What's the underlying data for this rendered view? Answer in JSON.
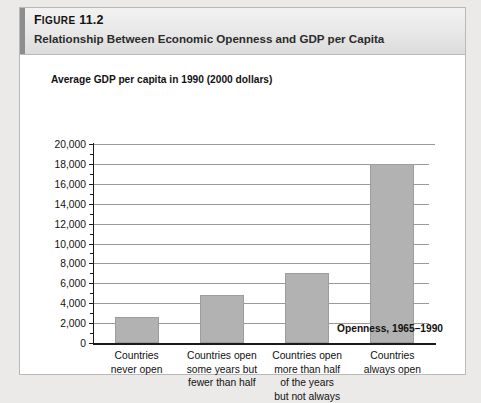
{
  "figure": {
    "label_prefix": "F",
    "label_rest": "IGURE",
    "label_number": "11.2",
    "label_full": "FIGURE 11.2",
    "subtitle": "Relationship Between Economic Openness and GDP per Capita",
    "accent_color": "#8d8d8d",
    "panel_background": "#ffffff",
    "page_background": "#eceae8"
  },
  "chart_data": {
    "type": "bar",
    "title": "Relationship Between Economic Openness and GDP per Capita",
    "ylabel": "Average GDP per capita in 1990 (2000 dollars)",
    "xlabel": "Openness, 1965–1990",
    "categories": [
      "Countries\nnever open",
      "Countries open\nsome years but\nfewer than half",
      "Countries open\nmore than half\nof the years\nbut not always",
      "Countries\nalways open"
    ],
    "category_lines": [
      [
        "Countries",
        "never open"
      ],
      [
        "Countries open",
        "some years but",
        "fewer than half"
      ],
      [
        "Countries open",
        "more than half",
        "of the years",
        "but not always"
      ],
      [
        "Countries",
        "always open"
      ]
    ],
    "values": [
      2600,
      4800,
      7000,
      18000
    ],
    "ylim": [
      0,
      20000
    ],
    "ytick_labels": [
      "20,000",
      "18,000",
      "16,000",
      "14,000",
      "12,000",
      "10,000",
      "8,000",
      "6,000",
      "4,000",
      "2,000",
      "0"
    ],
    "ytick_values": [
      20000,
      18000,
      16000,
      14000,
      12000,
      10000,
      8000,
      6000,
      4000,
      2000,
      0
    ],
    "ytick_minor_values": [
      19000,
      17000,
      15000,
      13000,
      11000,
      9000,
      7000,
      5000,
      3000,
      1000
    ],
    "grid": true,
    "legend": "none",
    "bar_color": "#b2b2b2",
    "gridline_color": "#9a9a9a",
    "axis_color": "#1a1a1a"
  }
}
